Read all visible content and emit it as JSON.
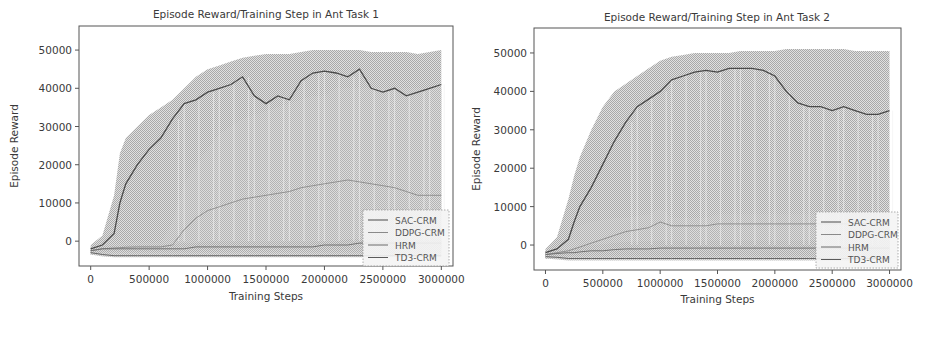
{
  "chart_data": [
    {
      "type": "line",
      "title": "Episode Reward/Training Step in Ant Task 1",
      "xlabel": "Training Steps",
      "ylabel": "Episode Reward",
      "xlim": [
        -100000,
        3100000
      ],
      "ylim": [
        -6500,
        56300
      ],
      "xticks": [
        0,
        500000,
        1000000,
        1500000,
        2000000,
        2500000,
        3000000
      ],
      "xtick_labels": [
        "0",
        "500000",
        "1000000",
        "1500000",
        "2000000",
        "2500000",
        "3000000"
      ],
      "yticks": [
        0,
        10000,
        20000,
        30000,
        40000,
        50000
      ],
      "ytick_labels": [
        "0",
        "10000",
        "20000",
        "30000",
        "40000",
        "50000"
      ],
      "grid": false,
      "legend_position": "lower right",
      "legend": [
        "SAC-CRM",
        "DDPG-CRM",
        "HRM",
        "TD3-CRM"
      ],
      "x": [
        0,
        100000,
        200000,
        250000,
        300000,
        400000,
        500000,
        600000,
        700000,
        800000,
        900000,
        1000000,
        1100000,
        1200000,
        1300000,
        1400000,
        1500000,
        1600000,
        1700000,
        1800000,
        1900000,
        2000000,
        2100000,
        2200000,
        2300000,
        2400000,
        2500000,
        2600000,
        2700000,
        2800000,
        2900000,
        3000000
      ],
      "series": [
        {
          "name": "SAC-CRM",
          "values": [
            -2000,
            -1000,
            2000,
            10000,
            15000,
            20000,
            24000,
            27000,
            32000,
            36000,
            37000,
            39000,
            40000,
            41000,
            43000,
            38000,
            36000,
            38000,
            37000,
            42000,
            44000,
            44500,
            44000,
            43000,
            45000,
            40000,
            39000,
            40000,
            38000,
            39000,
            40000,
            41000
          ],
          "upper": [
            -1000,
            1500,
            12000,
            23000,
            27000,
            30000,
            33000,
            35000,
            37000,
            40000,
            43000,
            45000,
            46000,
            47000,
            48000,
            48500,
            49000,
            49000,
            49000,
            49500,
            50000,
            50000,
            50000,
            50000,
            50000,
            49500,
            49500,
            49500,
            49500,
            49000,
            49500,
            50000
          ],
          "lower": [
            -3500,
            -3000,
            -2500,
            -2000,
            -2000,
            -2000,
            -2000,
            -2000,
            -2000,
            -2000,
            -2000,
            -2000,
            -2000,
            -2000,
            -2000,
            -2000,
            -2000,
            -2000,
            -2000,
            -2000,
            -2000,
            -2000,
            -2000,
            -2000,
            -2000,
            -2000,
            -2000,
            -2000,
            -2000,
            -2000,
            -2000,
            -2000
          ]
        },
        {
          "name": "DDPG-CRM",
          "values": [
            -2500,
            -2000,
            -1800,
            -1700,
            -1600,
            -1500,
            -1500,
            -1500,
            -1000,
            3000,
            6000,
            8000,
            9000,
            10000,
            11000,
            11500,
            12000,
            12500,
            13000,
            14000,
            14500,
            15000,
            15500,
            16000,
            15500,
            15000,
            14500,
            14000,
            13000,
            12000,
            12000,
            12000
          ],
          "upper": [
            -1500,
            -1000,
            -800,
            -700,
            -600,
            -500,
            -500,
            -500,
            5000,
            15000,
            20000,
            24000,
            28000,
            30000,
            32000,
            33000,
            34000,
            35000,
            36000,
            37000,
            38000,
            38000,
            40000,
            40000,
            40000,
            40000,
            40000,
            40000,
            40000,
            40000,
            40000,
            40000
          ],
          "lower": [
            -3500,
            -3000,
            -3000,
            -3000,
            -3000,
            -3000,
            -3000,
            -3000,
            -3000,
            -3000,
            -3000,
            -3000,
            -3000,
            -3000,
            -3000,
            -3000,
            -3000,
            -3000,
            -3000,
            -3000,
            -3000,
            -3000,
            -3000,
            -3000,
            -3000,
            -3000,
            -3000,
            -3000,
            -3000,
            -3000,
            -3000,
            -3000
          ]
        },
        {
          "name": "HRM",
          "values": [
            -2500,
            -2000,
            -2000,
            -2000,
            -2000,
            -2000,
            -2000,
            -2000,
            -2000,
            -2000,
            -1500,
            -1500,
            -1500,
            -1500,
            -1500,
            -1500,
            -1500,
            -1500,
            -1500,
            -1500,
            -1500,
            -1000,
            -1000,
            -1000,
            -500,
            -500,
            -500,
            -500,
            -500,
            -500,
            -500,
            -500
          ],
          "upper": [
            -1500,
            -1200,
            -1200,
            -1200,
            -1000,
            -1000,
            -1000,
            -1000,
            -800,
            -500,
            -500,
            0,
            0,
            0,
            0,
            0,
            0,
            0,
            0,
            0,
            0,
            0,
            0,
            500,
            500,
            500,
            500,
            500,
            500,
            500,
            500,
            500
          ],
          "lower": [
            -3500,
            -3500,
            -3500,
            -3500,
            -3500,
            -3500,
            -3500,
            -3500,
            -3500,
            -3500,
            -3500,
            -3500,
            -3500,
            -3500,
            -3500,
            -3500,
            -3500,
            -3500,
            -3500,
            -3500,
            -3500,
            -3500,
            -3500,
            -3500,
            -3500,
            -3500,
            -3500,
            -3500,
            -3500,
            -3500,
            -3500,
            -3500
          ]
        },
        {
          "name": "TD3-CRM",
          "values": [
            -3000,
            -3500,
            -3800,
            -3800,
            -3800,
            -3800,
            -3800,
            -3800,
            -3800,
            -3800,
            -3800,
            -3800,
            -3800,
            -3800,
            -3800,
            -3800,
            -3800,
            -3800,
            -3800,
            -3800,
            -3800,
            -3800,
            -3800,
            -3800,
            -3800,
            -3800,
            -3800,
            -3800,
            -3800,
            -3800,
            -3800,
            -3800
          ],
          "upper": [
            -2500,
            -3000,
            -3300,
            -3300,
            -3300,
            -3300,
            -3300,
            -3300,
            -3300,
            -3300,
            -3300,
            -3300,
            -3300,
            -3300,
            -3300,
            -3300,
            -3300,
            -3300,
            -3300,
            -3300,
            -3300,
            -3300,
            -3300,
            -3300,
            -3300,
            -3300,
            -3300,
            -3300,
            -3300,
            -3300,
            -3300,
            -3300
          ],
          "lower": [
            -3500,
            -4000,
            -4200,
            -4200,
            -4200,
            -4200,
            -4200,
            -4200,
            -4200,
            -4200,
            -4200,
            -4200,
            -4200,
            -4200,
            -4200,
            -4200,
            -4200,
            -4200,
            -4200,
            -4200,
            -4200,
            -4200,
            -4200,
            -4200,
            -4200,
            -4200,
            -4200,
            -4200,
            -4200,
            -4200,
            -4200,
            -4200
          ]
        }
      ]
    },
    {
      "type": "line",
      "title": "Episode Reward/Training Step in Ant Task 2",
      "xlabel": "Training Steps",
      "ylabel": "Episode Reward",
      "xlim": [
        -100000,
        3100000
      ],
      "ylim": [
        -6500,
        56500
      ],
      "xticks": [
        0,
        500000,
        1000000,
        1500000,
        2000000,
        2500000,
        3000000
      ],
      "xtick_labels": [
        "0",
        "500000",
        "1000000",
        "1500000",
        "2000000",
        "2500000",
        "3000000"
      ],
      "yticks": [
        0,
        10000,
        20000,
        30000,
        40000,
        50000
      ],
      "ytick_labels": [
        "0",
        "10000",
        "20000",
        "30000",
        "40000",
        "50000"
      ],
      "grid": false,
      "legend_position": "lower right",
      "legend": [
        "SAC-CRM",
        "DDPG-CRM",
        "HRM",
        "TD3-CRM"
      ],
      "x": [
        0,
        100000,
        200000,
        250000,
        300000,
        400000,
        500000,
        600000,
        700000,
        800000,
        900000,
        1000000,
        1100000,
        1200000,
        1300000,
        1400000,
        1500000,
        1600000,
        1700000,
        1800000,
        1900000,
        2000000,
        2100000,
        2200000,
        2300000,
        2400000,
        2500000,
        2600000,
        2700000,
        2800000,
        2900000,
        3000000
      ],
      "series": [
        {
          "name": "SAC-CRM",
          "values": [
            -2000,
            -1000,
            1500,
            6000,
            10000,
            15000,
            21000,
            27000,
            32000,
            36000,
            38000,
            40000,
            43000,
            44000,
            45000,
            45500,
            45000,
            46000,
            46000,
            46000,
            45500,
            44000,
            40000,
            37000,
            36000,
            36000,
            35000,
            36000,
            35000,
            34000,
            34000,
            35000
          ],
          "upper": [
            -1000,
            2000,
            12000,
            18000,
            23000,
            30000,
            36000,
            40000,
            42000,
            44000,
            46000,
            48000,
            49000,
            49500,
            50000,
            50000,
            50000,
            50000,
            50500,
            50500,
            50500,
            50500,
            51000,
            51000,
            51000,
            51000,
            51000,
            51000,
            50500,
            50500,
            50500,
            50500
          ],
          "lower": [
            -3500,
            -3000,
            -3000,
            -2500,
            -2500,
            -2500,
            -2500,
            -2500,
            -2500,
            -2500,
            -2500,
            -2500,
            -2500,
            -2500,
            -2500,
            -2500,
            -2500,
            -2500,
            -2500,
            -2500,
            -2500,
            -2500,
            -2500,
            -2500,
            -2500,
            -2500,
            -2500,
            -2500,
            -2500,
            -2500,
            -2500,
            -2500
          ]
        },
        {
          "name": "DDPG-CRM",
          "values": [
            -2500,
            -2000,
            -1500,
            -1000,
            -500,
            500,
            1500,
            2500,
            3500,
            4000,
            4500,
            6000,
            5000,
            5000,
            5000,
            5000,
            5500,
            5500,
            5500,
            5500,
            5500,
            5500,
            5500,
            5500,
            5500,
            5500,
            5500,
            5500,
            5500,
            5500,
            5500,
            5500
          ],
          "upper": [
            -1500,
            -1000,
            2000,
            4000,
            5000,
            6000,
            6500,
            7000,
            7000,
            7500,
            8000,
            9500,
            7000,
            7000,
            7000,
            7000,
            8000,
            8000,
            8000,
            8000,
            8000,
            8000,
            8000,
            8000,
            8000,
            8000,
            8000,
            8000,
            8000,
            8000,
            8000,
            8000
          ],
          "lower": [
            -3500,
            -3000,
            -3000,
            -3000,
            -3000,
            -3000,
            -3000,
            -3000,
            -3000,
            -3000,
            -3000,
            -3000,
            -3000,
            -3000,
            -3000,
            -3000,
            -3000,
            -3000,
            -3000,
            -3000,
            -3000,
            -3000,
            -3000,
            -3000,
            -3000,
            -3000,
            -3000,
            -3000,
            -3000,
            -3000,
            -3000,
            -3000
          ]
        },
        {
          "name": "HRM",
          "values": [
            -2500,
            -2200,
            -2000,
            -2000,
            -1800,
            -1500,
            -1500,
            -1200,
            -1000,
            -1000,
            -1000,
            -800,
            -800,
            -800,
            -800,
            -800,
            -800,
            -800,
            -800,
            -800,
            -800,
            -800,
            -800,
            -800,
            -800,
            -800,
            -800,
            -800,
            -800,
            -800,
            -800,
            -800
          ],
          "upper": [
            -1500,
            -1200,
            -1000,
            -800,
            -500,
            0,
            200,
            500,
            800,
            1000,
            1000,
            1200,
            1200,
            1200,
            1200,
            1200,
            1200,
            1200,
            1200,
            1200,
            1200,
            1200,
            1200,
            1200,
            1200,
            1200,
            1200,
            1200,
            1200,
            1200,
            1200,
            1200
          ],
          "lower": [
            -3500,
            -3500,
            -3500,
            -3500,
            -3500,
            -3500,
            -3500,
            -3500,
            -3500,
            -3500,
            -3500,
            -3500,
            -3500,
            -3500,
            -3500,
            -3500,
            -3500,
            -3500,
            -3500,
            -3500,
            -3500,
            -3500,
            -3500,
            -3500,
            -3500,
            -3500,
            -3500,
            -3500,
            -3500,
            -3500,
            -3500,
            -3500
          ]
        },
        {
          "name": "TD3-CRM",
          "values": [
            -3000,
            -3200,
            -3500,
            -3500,
            -3500,
            -3500,
            -3500,
            -3500,
            -3500,
            -3500,
            -3500,
            -3500,
            -3500,
            -3500,
            -3500,
            -3500,
            -3500,
            -3500,
            -3500,
            -3500,
            -3500,
            -3500,
            -3500,
            -3500,
            -3500,
            -3500,
            -3500,
            -3500,
            -3500,
            -3500,
            -3500,
            -3500
          ],
          "upper": [
            -2500,
            -2800,
            -3000,
            -3000,
            -3000,
            -3000,
            -3000,
            -3000,
            -3000,
            -3000,
            -3000,
            -3000,
            -3000,
            -3000,
            -3000,
            -3000,
            -3000,
            -3000,
            -3000,
            -3000,
            -3000,
            -3000,
            -3000,
            -3000,
            -3000,
            -3000,
            -3000,
            -3000,
            -3000,
            -3000,
            -3000,
            -3000
          ],
          "lower": [
            -3500,
            -3800,
            -4000,
            -4000,
            -4000,
            -4000,
            -4000,
            -4000,
            -4000,
            -4000,
            -4000,
            -4000,
            -4000,
            -4000,
            -4000,
            -4000,
            -4000,
            -4000,
            -4000,
            -4000,
            -4000,
            -4000,
            -4000,
            -4000,
            -4000,
            -4000,
            -4000,
            -4000,
            -4000,
            -4000,
            -4000,
            -4000
          ]
        }
      ]
    }
  ],
  "style": {
    "series_colors": [
      "#4a4a4a",
      "#8a8a8a",
      "#6a6a6a",
      "#5a5a5a"
    ],
    "band_colors": [
      "#9a9a9a",
      "#b5b5b5",
      "#a8a8a8",
      "#b0b0b0"
    ],
    "axes_color": "#555555",
    "text_color": "#3a3a3a"
  },
  "layout": [
    {
      "offset_x": 0,
      "plot": {
        "left": 79,
        "top": 26,
        "right": 453,
        "bottom": 266
      },
      "title_x": 266,
      "title_y": 18,
      "xlabel_y": 300,
      "ylabel_x": 18,
      "legend": {
        "x": 363,
        "y": 210,
        "w": 86,
        "h": 56
      }
    },
    {
      "offset_x": 456,
      "plot": {
        "left": 78,
        "top": 28,
        "right": 445,
        "bottom": 270
      },
      "title_x": 261,
      "title_y": 21,
      "xlabel_y": 303,
      "ylabel_x": 24,
      "legend": {
        "x": 360,
        "y": 212,
        "w": 82,
        "h": 56
      }
    }
  ]
}
